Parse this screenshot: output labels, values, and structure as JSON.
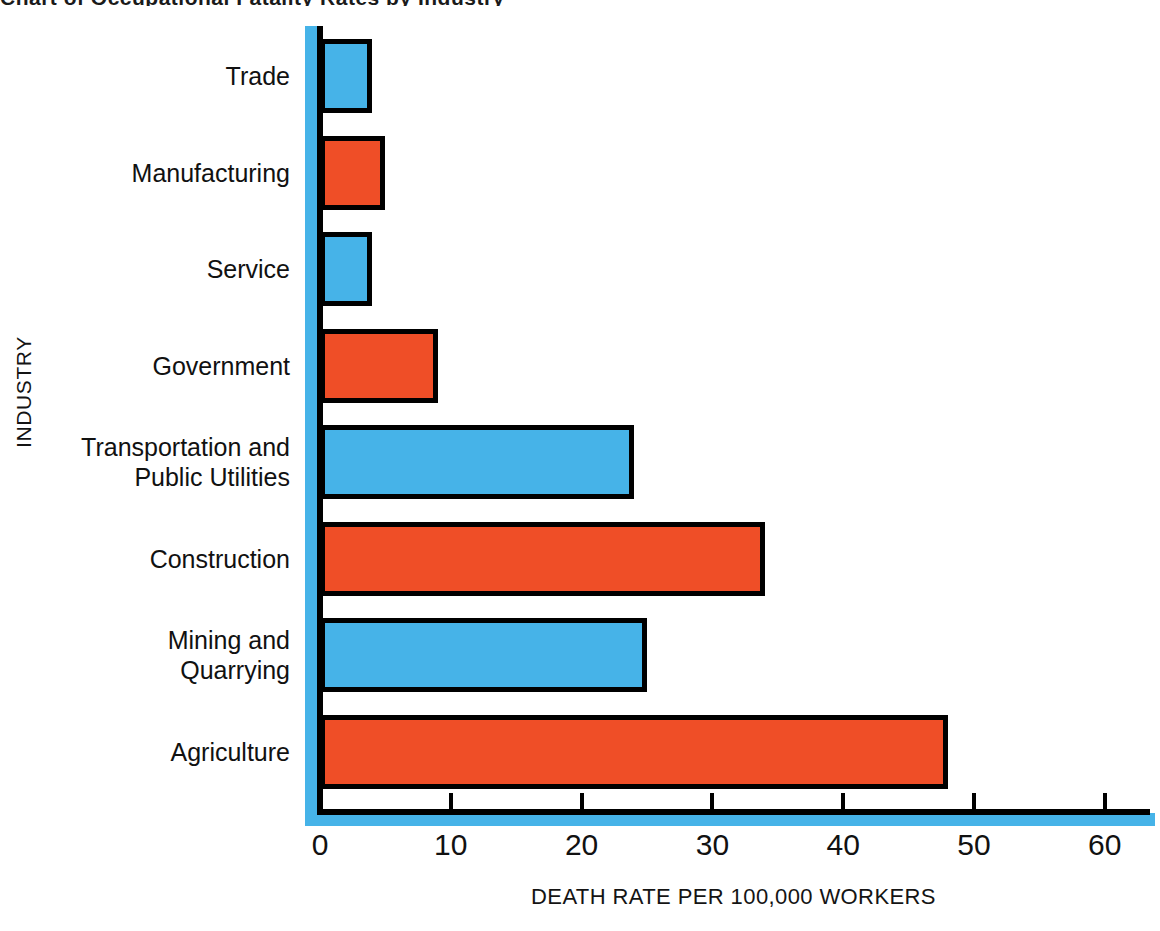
{
  "figure": {
    "title_fragment": "Chart of Occupational Fatality Rates by Industry",
    "background_color": "#ffffff"
  },
  "axes": {
    "y_axis_title": "INDUSTRY",
    "x_axis_title": "DEATH RATE PER 100,000 WORKERS",
    "x_ticks": [
      "0",
      "10",
      "20",
      "30",
      "40",
      "50",
      "60"
    ]
  },
  "colors": {
    "blue": "#46b3e8",
    "red": "#ef4e27",
    "outline": "#000000"
  },
  "chart_data": {
    "type": "bar",
    "orientation": "horizontal",
    "title": "",
    "xlabel": "DEATH RATE PER 100,000 WORKERS",
    "ylabel": "INDUSTRY",
    "xlim": [
      0,
      62
    ],
    "grid": false,
    "legend": "none",
    "categories": [
      "Trade",
      "Manufacturing",
      "Service",
      "Government",
      "Transportation and\nPublic Utilities",
      "Construction",
      "Mining and\nQuarrying",
      "Agriculture"
    ],
    "values": [
      4,
      5,
      4,
      9,
      24,
      34,
      25,
      48
    ],
    "bar_colors": [
      "blue",
      "red",
      "blue",
      "red",
      "blue",
      "red",
      "blue",
      "red"
    ],
    "xticks": [
      0,
      10,
      20,
      30,
      40,
      50,
      60
    ]
  }
}
